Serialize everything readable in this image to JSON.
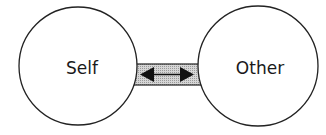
{
  "diagram": {
    "nodes": [
      {
        "id": "self",
        "label": "Self"
      },
      {
        "id": "other",
        "label": "Other"
      }
    ],
    "connector": {
      "type": "bidirectional-arrow",
      "from": "self",
      "to": "other",
      "fill": "#c8c8c8"
    },
    "colors": {
      "stroke": "#222222",
      "background": "#ffffff",
      "bridge_fill": "#c4c4c4"
    }
  }
}
